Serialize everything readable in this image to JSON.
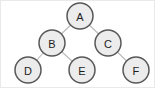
{
  "diagram": {
    "canvas": {
      "width": 155,
      "height": 88,
      "background": "#ffffff",
      "border_color": "#e9e9e9"
    },
    "style": {
      "node_fill": "#ececec",
      "node_stroke": "#585858",
      "node_radius": 13,
      "edge_color": "#b9b9b9",
      "label_color": "#1c1c1c"
    }
  },
  "chart_data": {
    "type": "diagram",
    "subtype": "binary-tree",
    "nodes": [
      {
        "id": "A",
        "label": "A",
        "x": 79,
        "y": 15,
        "r": 13,
        "level": 0
      },
      {
        "id": "B",
        "label": "B",
        "x": 51,
        "y": 42,
        "r": 13,
        "level": 1
      },
      {
        "id": "C",
        "label": "C",
        "x": 107,
        "y": 42,
        "r": 13,
        "level": 1
      },
      {
        "id": "D",
        "label": "D",
        "x": 27,
        "y": 69,
        "r": 13,
        "level": 2
      },
      {
        "id": "E",
        "label": "E",
        "x": 81,
        "y": 69,
        "r": 13,
        "level": 2
      },
      {
        "id": "F",
        "label": "F",
        "x": 135,
        "y": 69,
        "r": 13,
        "level": 2
      }
    ],
    "edges": [
      {
        "from": "A",
        "to": "B",
        "x1": 79,
        "y1": 15,
        "x2": 51,
        "y2": 42
      },
      {
        "from": "A",
        "to": "C",
        "x1": 79,
        "y1": 15,
        "x2": 107,
        "y2": 42
      },
      {
        "from": "B",
        "to": "D",
        "x1": 51,
        "y1": 42,
        "x2": 27,
        "y2": 69
      },
      {
        "from": "B",
        "to": "E",
        "x1": 51,
        "y1": 42,
        "x2": 81,
        "y2": 69
      },
      {
        "from": "C",
        "to": "F",
        "x1": 107,
        "y1": 42,
        "x2": 135,
        "y2": 69
      }
    ],
    "root": "A",
    "leaves": [
      "D",
      "E",
      "F"
    ],
    "depth": 3,
    "node_count": 6,
    "edge_count": 5
  }
}
